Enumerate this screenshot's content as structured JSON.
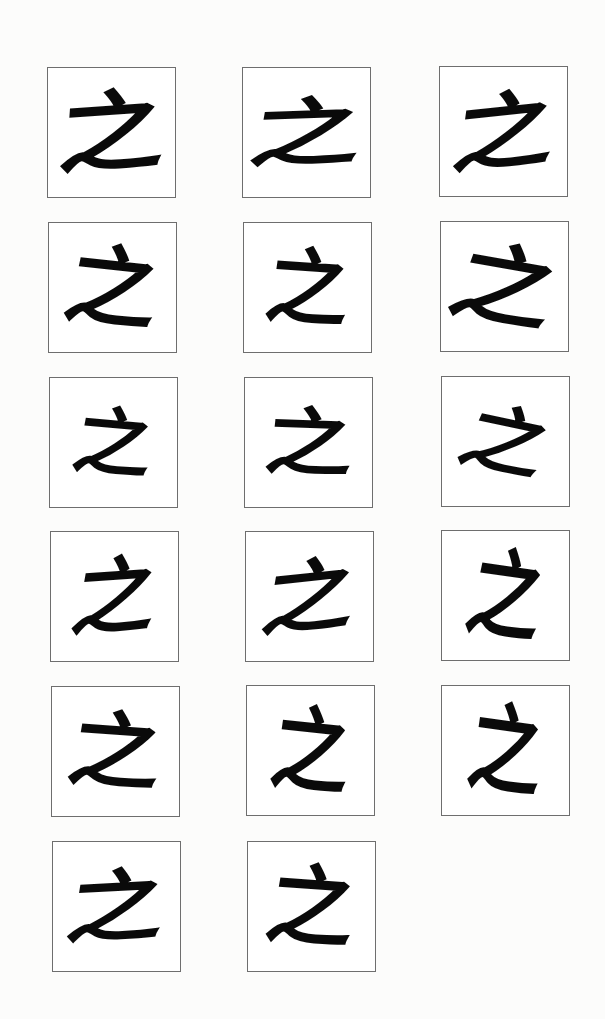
{
  "page": {
    "title": ""
  },
  "specimens": [
    {
      "char": "之",
      "x": 47,
      "y": 67,
      "rot": -4,
      "sx": 1.15,
      "sy": 0.95,
      "skew": -8
    },
    {
      "char": "之",
      "x": 242,
      "y": 67,
      "rot": -2,
      "sx": 1.2,
      "sy": 0.8,
      "skew": -12
    },
    {
      "char": "之",
      "x": 439,
      "y": 66,
      "rot": -6,
      "sx": 1.1,
      "sy": 0.9,
      "skew": -14
    },
    {
      "char": "之",
      "x": 48,
      "y": 222,
      "rot": 6,
      "sx": 1.0,
      "sy": 0.95,
      "skew": -6
    },
    {
      "char": "之",
      "x": 243,
      "y": 222,
      "rot": 4,
      "sx": 0.9,
      "sy": 0.9,
      "skew": -4
    },
    {
      "char": "之",
      "x": 440,
      "y": 221,
      "rot": 10,
      "sx": 1.1,
      "sy": 0.95,
      "skew": -10
    },
    {
      "char": "之",
      "x": 49,
      "y": 377,
      "rot": 5,
      "sx": 0.85,
      "sy": 0.8,
      "skew": -6
    },
    {
      "char": "之",
      "x": 244,
      "y": 377,
      "rot": 2,
      "sx": 0.95,
      "sy": 0.8,
      "skew": -4
    },
    {
      "char": "之",
      "x": 441,
      "y": 376,
      "rot": 12,
      "sx": 0.9,
      "sy": 0.8,
      "skew": -12
    },
    {
      "char": "之",
      "x": 50,
      "y": 531,
      "rot": -4,
      "sx": 0.9,
      "sy": 0.9,
      "skew": -14
    },
    {
      "char": "之",
      "x": 245,
      "y": 531,
      "rot": -6,
      "sx": 1.0,
      "sy": 0.85,
      "skew": -16
    },
    {
      "char": "之",
      "x": 441,
      "y": 530,
      "rot": 8,
      "sx": 0.8,
      "sy": 1.05,
      "skew": -4
    },
    {
      "char": "之",
      "x": 51,
      "y": 686,
      "rot": 4,
      "sx": 1.0,
      "sy": 0.9,
      "skew": -6
    },
    {
      "char": "之",
      "x": 246,
      "y": 685,
      "rot": 6,
      "sx": 0.85,
      "sy": 1.0,
      "skew": -2
    },
    {
      "char": "之",
      "x": 441,
      "y": 685,
      "rot": 8,
      "sx": 0.8,
      "sy": 1.05,
      "skew": 0
    },
    {
      "char": "之",
      "x": 52,
      "y": 841,
      "rot": -3,
      "sx": 1.05,
      "sy": 0.85,
      "skew": -12
    },
    {
      "char": "之",
      "x": 247,
      "y": 841,
      "rot": 4,
      "sx": 0.95,
      "sy": 0.95,
      "skew": -6
    }
  ],
  "colors": {
    "ink": "#0a0a0a",
    "border": "#6e6e6e",
    "paper": "#ffffff",
    "background": "#fcfcfb"
  }
}
